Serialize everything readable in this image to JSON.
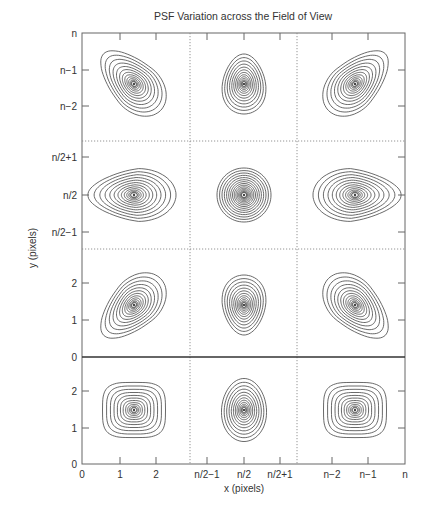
{
  "chart_data": {
    "type": "contour",
    "title": "PSF Variation across the Field of View",
    "xlabel": "x (pixels)",
    "ylabel": "y (pixels)",
    "grid": false,
    "x_tick_labels": [
      "0",
      "1",
      "2",
      "n/2−1",
      "n/2",
      "n/2+1",
      "n−2",
      "n−1",
      "n"
    ],
    "y_tick_labels_top_panel": [
      "n",
      "n−1",
      "n−2"
    ],
    "y_tick_labels_middle_panel": [
      "n/2+1",
      "n/2",
      "n/2−1"
    ],
    "y_tick_labels_lower_panel": [
      "2",
      "1",
      "0"
    ],
    "y_tick_labels_bottom_panel": [
      "2",
      "1",
      "0"
    ],
    "panels": [
      {
        "row": "top",
        "col": "left",
        "shape": "tilted-teardrop",
        "tilt": "down-right",
        "center": [
          1.4,
          "n−1.4"
        ],
        "rings": 13
      },
      {
        "row": "top",
        "col": "center",
        "shape": "egg",
        "tilt": "vertical",
        "center": [
          "n/2",
          "n−1.3"
        ],
        "rings": 13
      },
      {
        "row": "top",
        "col": "right",
        "shape": "tilted-teardrop",
        "tilt": "down-left",
        "center": [
          "n−1.4",
          "n−1.4"
        ],
        "rings": 13
      },
      {
        "row": "middle",
        "col": "left",
        "shape": "teardrop",
        "tilt": "pointing-left",
        "center": [
          1.4,
          "n/2"
        ],
        "rings": 13
      },
      {
        "row": "middle",
        "col": "center",
        "shape": "circle",
        "tilt": "none",
        "center": [
          "n/2",
          "n/2"
        ],
        "rings": 16
      },
      {
        "row": "middle",
        "col": "right",
        "shape": "teardrop",
        "tilt": "pointing-right",
        "center": [
          "n−1.4",
          "n/2"
        ],
        "rings": 13
      },
      {
        "row": "lower",
        "col": "left",
        "shape": "tilted-teardrop",
        "tilt": "up-right",
        "center": [
          1.4,
          1.4
        ],
        "rings": 13
      },
      {
        "row": "lower",
        "col": "center",
        "shape": "egg",
        "tilt": "vertical-inverted",
        "center": [
          "n/2",
          1.35
        ],
        "rings": 13
      },
      {
        "row": "lower",
        "col": "right",
        "shape": "tilted-teardrop",
        "tilt": "up-left",
        "center": [
          "n−1.4",
          1.4
        ],
        "rings": 13
      },
      {
        "row": "bottom",
        "col": "left",
        "shape": "rounded-square",
        "tilt": "none",
        "center": [
          1.4,
          1.5
        ],
        "rings": 12
      },
      {
        "row": "bottom",
        "col": "center",
        "shape": "oval",
        "tilt": "vertical",
        "center": [
          "n/2",
          1.5
        ],
        "rings": 13
      },
      {
        "row": "bottom",
        "col": "right",
        "shape": "rounded-square",
        "tilt": "none",
        "center": [
          "n−1.4",
          1.5
        ],
        "rings": 12
      }
    ],
    "layout": {
      "frame": [
        82,
        33,
        405,
        464
      ],
      "x_ticks_px": [
        82,
        120,
        156,
        207,
        244,
        280,
        332,
        368,
        405
      ],
      "y_ticks_px": {
        "top": [
          33,
          70,
          106
        ],
        "middle": [
          157,
          195,
          232
        ],
        "lower": [
          283,
          320,
          357
        ],
        "bottom": [
          391,
          428,
          464
        ]
      },
      "dotted_vertical_px": [
        190,
        297
      ],
      "dotted_horizontal_px": [
        141,
        249
      ],
      "solid_horizontal_px": [
        357
      ]
    },
    "colors": {
      "line": "#444444",
      "frame": "#666666",
      "dotted": "#888888"
    }
  },
  "caption": "Fig. 4.3  PSF variation of a camera lens system across the field of view"
}
